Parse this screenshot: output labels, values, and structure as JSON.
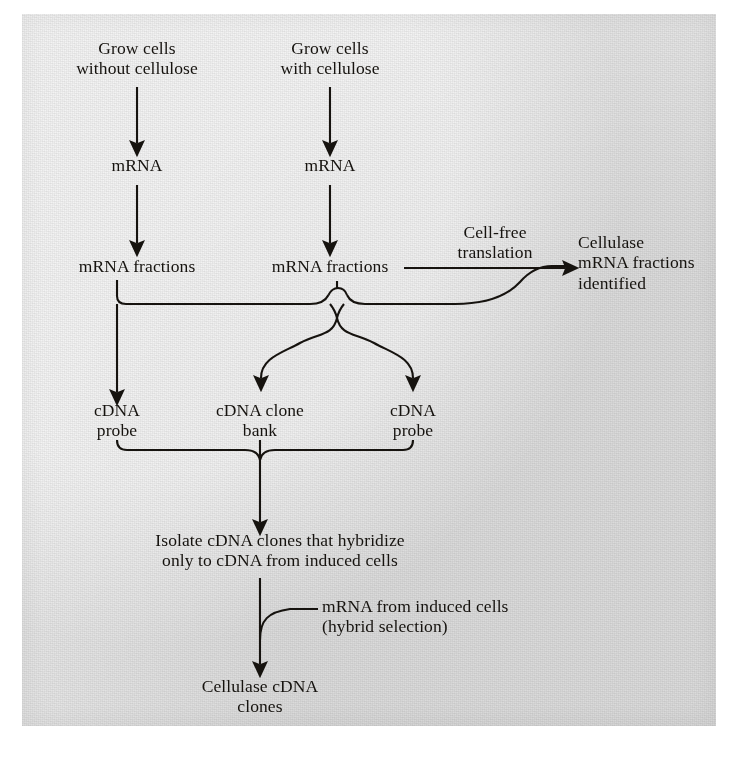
{
  "figure": {
    "kind": "flowchart",
    "background_color": "#e4e4e4",
    "ink_color": "#16130f",
    "page_color": "#ffffff"
  },
  "nodes": {
    "grow_without": "Grow cells\nwithout cellulose",
    "grow_with": "Grow cells\nwith cellulose",
    "mrna_left": "mRNA",
    "mrna_right": "mRNA",
    "mrna_fractions_left": "mRNA fractions",
    "mrna_fractions_right": "mRNA fractions",
    "cellulase_identified": "Cellulase\nmRNA fractions\nidentified",
    "cdna_probe_left": "cDNA\nprobe",
    "cdna_clone_bank": "cDNA clone\nbank",
    "cdna_probe_right": "cDNA\nprobe",
    "isolate_clones": "Isolate cDNA clones that hybridize\nonly to cDNA from induced cells",
    "cellulase_cdna_clones": "Cellulase cDNA\nclones"
  },
  "edge_labels": {
    "cell_free_translation": "Cell-free\ntranslation",
    "hybrid_selection": "mRNA from induced cells\n(hybrid selection)"
  },
  "flow_sequence": [
    "Grow cells without cellulose",
    "Grow cells with cellulose",
    "mRNA",
    "mRNA fractions",
    "Cell-free translation",
    "Cellulase mRNA fractions identified",
    "cDNA probe",
    "cDNA clone bank",
    "Isolate cDNA clones that hybridize only to cDNA from induced cells",
    "mRNA from induced cells (hybrid selection)",
    "Cellulase cDNA clones"
  ]
}
